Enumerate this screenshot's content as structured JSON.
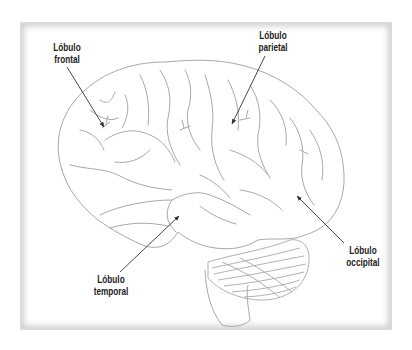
{
  "diagram": {
    "type": "anatomical-illustration",
    "line_color": "#a8a8a8",
    "arrow_color": "#333333",
    "labels": [
      {
        "id": "frontal",
        "line1": "Lóbulo",
        "line2": "frontal"
      },
      {
        "id": "parietal",
        "line1": "Lóbulo",
        "line2": "parietal"
      },
      {
        "id": "temporal",
        "line1": "Lóbulo",
        "line2": "temporal"
      },
      {
        "id": "occipital",
        "line1": "Lóbulo",
        "line2": "occipital"
      }
    ]
  }
}
